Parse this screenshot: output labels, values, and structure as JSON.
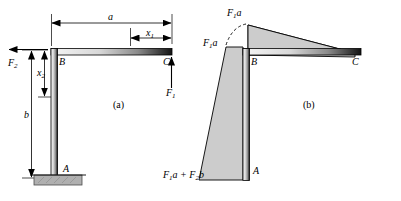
{
  "figure": {
    "panels": [
      {
        "id": "a",
        "label": "(a)",
        "x": 116,
        "y": 104
      },
      {
        "id": "b",
        "label": "(b)",
        "x": 306,
        "y": 104
      }
    ],
    "colors": {
      "line": "#000000",
      "member_light": "#f2f2f2",
      "member_dark": "#1a1a1a",
      "shade_fill": "#cccccc",
      "ground_fill": "#b3b3b3",
      "background": "#ffffff"
    }
  },
  "panel_a": {
    "name": "free-body-diagram",
    "points": [
      {
        "name": "A",
        "label": "A",
        "x": 63,
        "y": 170
      },
      {
        "name": "B",
        "label": "B",
        "x": 55,
        "y": 62
      },
      {
        "name": "C",
        "label": "C",
        "x": 165,
        "y": 62
      }
    ],
    "dimensions": [
      {
        "name": "a",
        "label": "a",
        "x": 110,
        "y": 18,
        "orientation": "horizontal"
      },
      {
        "name": "x1",
        "label": "x",
        "sub": "1",
        "x": 146,
        "y": 33,
        "orientation": "horizontal"
      },
      {
        "name": "b",
        "label": "b",
        "x": 22,
        "y": 116,
        "orientation": "vertical"
      },
      {
        "name": "x2",
        "label": "x",
        "sub": "2",
        "x": 38,
        "y": 80,
        "orientation": "vertical"
      }
    ],
    "forces": [
      {
        "name": "F2",
        "label": "F",
        "sub": "2",
        "x": 8,
        "y": 70,
        "direction": "left"
      },
      {
        "name": "F1",
        "label": "F",
        "sub": "1",
        "x": 169,
        "y": 92,
        "direction": "up"
      }
    ],
    "support": {
      "name": "fixed-support",
      "label": ""
    }
  },
  "panel_b": {
    "name": "bending-moment-diagram",
    "points": [
      {
        "name": "A",
        "label": "A",
        "x": 253,
        "y": 170
      },
      {
        "name": "B",
        "label": "B",
        "x": 247,
        "y": 62
      },
      {
        "name": "C",
        "label": "C",
        "x": 355,
        "y": 62
      }
    ],
    "annotations": [
      {
        "name": "moment-at-B-top",
        "label": "F",
        "sub": "1",
        "tail": "a",
        "x": 228,
        "y": 10
      },
      {
        "name": "moment-at-B-side",
        "label": "F",
        "sub": "1",
        "tail": "a",
        "x": 205,
        "y": 41
      },
      {
        "name": "moment-at-A",
        "label": "F",
        "sub": "1",
        "mid": "a + ",
        "label2": "F",
        "sub2": "2",
        "tail2": "b",
        "x": 178,
        "y": 170
      }
    ]
  }
}
